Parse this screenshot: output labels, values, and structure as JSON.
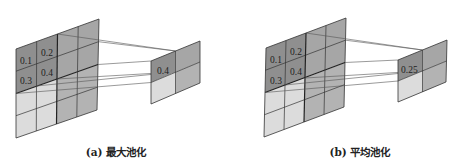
{
  "figure": {
    "panels": [
      {
        "id": "a",
        "caption": "(a)  最大池化",
        "input_grid": {
          "rows": 4,
          "cols": 4,
          "highlighted_values": [
            "0.1",
            "0.2",
            "0.3",
            "0.4"
          ]
        },
        "output_grid": {
          "rows": 2,
          "cols": 2,
          "highlighted_value": "0.4"
        }
      },
      {
        "id": "b",
        "caption": "(b)  平均池化",
        "input_grid": {
          "rows": 4,
          "cols": 4,
          "highlighted_values": [
            "0.1",
            "0.2",
            "0.3",
            "0.4"
          ]
        },
        "output_grid": {
          "rows": 2,
          "cols": 2,
          "highlighted_value": "0.25"
        }
      }
    ],
    "colors": {
      "dark_quadrant": "#8f8f8f",
      "mid_quadrant": "#b3b3b3",
      "light_quadrant": "#dcdcdc",
      "grid_line": "#333333",
      "connector_line": "#555555"
    }
  }
}
